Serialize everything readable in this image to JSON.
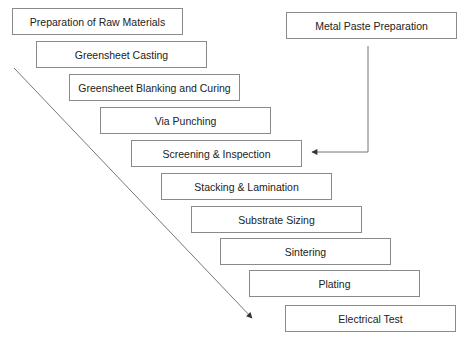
{
  "diagram": {
    "type": "process-flow",
    "colors": {
      "stroke": "#8a8a8a",
      "arrow": "#444444",
      "text": "#222222",
      "background": "#ffffff"
    },
    "steps": [
      {
        "label": "Preparation of Raw Materials",
        "x": 12,
        "y": 8
      },
      {
        "label": "Greensheet Casting",
        "x": 36,
        "y": 41
      },
      {
        "label": "Greensheet Blanking and Curing",
        "x": 69,
        "y": 74
      },
      {
        "label": "Via Punching",
        "x": 100,
        "y": 107
      },
      {
        "label": "Screening & Inspection",
        "x": 131,
        "y": 140
      },
      {
        "label": "Stacking & Lamination",
        "x": 161,
        "y": 173
      },
      {
        "label": "Substrate Sizing",
        "x": 191,
        "y": 206
      },
      {
        "label": "Sintering",
        "x": 220,
        "y": 238
      },
      {
        "label": "Plating",
        "x": 249,
        "y": 270
      },
      {
        "label": "Electrical Test",
        "x": 285,
        "y": 305
      }
    ],
    "side_input": {
      "label": "Metal Paste Preparation",
      "x": 286,
      "y": 12,
      "feeds_into": "Screening & Inspection"
    },
    "flow_arrow": {
      "from": [
        14,
        68
      ],
      "to": [
        252,
        318
      ]
    }
  }
}
